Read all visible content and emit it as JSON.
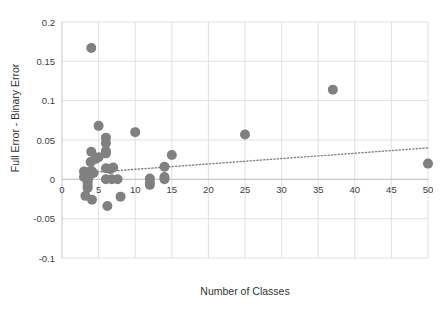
{
  "chart_data": {
    "type": "scatter",
    "title": "",
    "xlabel": "Number of Classes",
    "ylabel": "Full Error - Binary Error",
    "xlim": [
      0,
      50
    ],
    "ylim": [
      -0.1,
      0.2
    ],
    "grid": true,
    "legend": "none",
    "xticks": [
      0,
      5,
      10,
      15,
      20,
      25,
      30,
      35,
      40,
      45,
      50
    ],
    "xtick_labels": [
      "0",
      "5",
      "10",
      "15",
      "20",
      "25",
      "30",
      "35",
      "40",
      "45",
      "50"
    ],
    "yticks": [
      -0.1,
      -0.05,
      0,
      0.05,
      0.1,
      0.15,
      0.2
    ],
    "ytick_labels": [
      "-0.1",
      "-0.05",
      "0",
      "0.05",
      "0.1",
      "0.15",
      "0.2"
    ],
    "marker_color": "#808080",
    "marker_size": 5,
    "points": [
      {
        "x": 4.0,
        "y": 0.167
      },
      {
        "x": 5.0,
        "y": 0.068
      },
      {
        "x": 6.0,
        "y": 0.053
      },
      {
        "x": 10.0,
        "y": 0.06
      },
      {
        "x": 6.0,
        "y": 0.046
      },
      {
        "x": 6.0,
        "y": 0.036
      },
      {
        "x": 6.0,
        "y": 0.033
      },
      {
        "x": 4.0,
        "y": 0.035
      },
      {
        "x": 4.6,
        "y": 0.026
      },
      {
        "x": 3.9,
        "y": 0.022
      },
      {
        "x": 5.0,
        "y": 0.028
      },
      {
        "x": 15.0,
        "y": 0.031
      },
      {
        "x": 25.0,
        "y": 0.057
      },
      {
        "x": 37.0,
        "y": 0.114
      },
      {
        "x": 50.0,
        "y": 0.02
      },
      {
        "x": 3.0,
        "y": 0.01
      },
      {
        "x": 3.4,
        "y": 0.009
      },
      {
        "x": 4.0,
        "y": 0.011
      },
      {
        "x": 4.3,
        "y": 0.008
      },
      {
        "x": 6.0,
        "y": 0.014
      },
      {
        "x": 6.6,
        "y": 0.013
      },
      {
        "x": 7.0,
        "y": 0.015
      },
      {
        "x": 14.0,
        "y": 0.016
      },
      {
        "x": 3.0,
        "y": 0.003
      },
      {
        "x": 3.6,
        "y": 0.001
      },
      {
        "x": 6.0,
        "y": 0.0
      },
      {
        "x": 6.8,
        "y": 0.0
      },
      {
        "x": 7.6,
        "y": 0.0
      },
      {
        "x": 12.0,
        "y": 0.001
      },
      {
        "x": 14.0,
        "y": 0.003
      },
      {
        "x": 14.0,
        "y": 0.0
      },
      {
        "x": 12.0,
        "y": -0.004
      },
      {
        "x": 12.0,
        "y": -0.007
      },
      {
        "x": 3.5,
        "y": -0.004
      },
      {
        "x": 3.5,
        "y": -0.008
      },
      {
        "x": 3.5,
        "y": -0.011
      },
      {
        "x": 3.2,
        "y": -0.021
      },
      {
        "x": 4.1,
        "y": -0.026
      },
      {
        "x": 8.0,
        "y": -0.022
      },
      {
        "x": 6.2,
        "y": -0.034
      }
    ],
    "trendline": {
      "style": "dotted",
      "color": "#808080",
      "x_start": 3.0,
      "y_start": 0.008,
      "x_end": 50.0,
      "y_end": 0.04
    }
  }
}
